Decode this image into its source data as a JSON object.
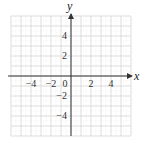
{
  "chart_data": {
    "type": "scatter",
    "title": "",
    "xlabel": "x",
    "ylabel": "y",
    "xlim": [
      -6,
      6
    ],
    "ylim": [
      -6,
      6
    ],
    "grid": true,
    "x_tick_labels": [
      "-4",
      "-2",
      "0",
      "2",
      "4"
    ],
    "x_tick_values": [
      -4,
      -2,
      0,
      2,
      4
    ],
    "y_tick_labels": [
      "4",
      "2",
      "-2",
      "-4"
    ],
    "y_tick_values": [
      4,
      2,
      -2,
      -4
    ],
    "series": [],
    "legend": null
  },
  "colors": {
    "grid": "#d4d4d4",
    "axis": "#333333",
    "text": "#333333",
    "background": "#ffffff"
  },
  "labels": {
    "x_axis": "x",
    "y_axis": "y",
    "origin": "0",
    "xt_m4": "−4",
    "xt_m2": "−2",
    "xt_2": "2",
    "xt_4": "4",
    "yt_4": "4",
    "yt_2": "2",
    "yt_m2": "−2",
    "yt_m4": "−4"
  }
}
